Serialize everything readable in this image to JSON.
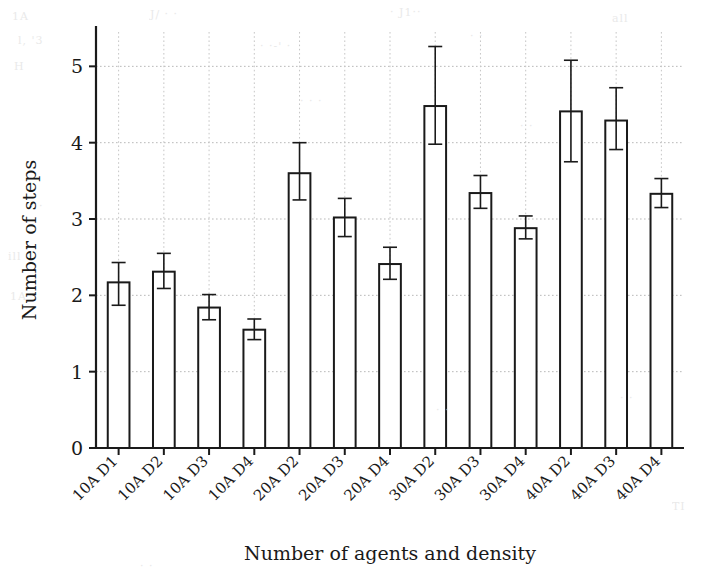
{
  "chart_data": {
    "type": "bar",
    "title": "",
    "xlabel": "Number of agents and density",
    "ylabel": "Number of steps",
    "categories": [
      "10A D1",
      "10A D2",
      "10A D3",
      "10A D4",
      "20A D2",
      "20A D3",
      "20A D4",
      "30A D2",
      "30A D3",
      "30A D4",
      "40A D2",
      "40A D3",
      "40A D4"
    ],
    "values": [
      2.17,
      2.31,
      1.84,
      1.55,
      3.6,
      3.02,
      2.41,
      4.48,
      3.34,
      2.88,
      4.41,
      4.29,
      3.33
    ],
    "errors_low": [
      0.3,
      0.22,
      0.16,
      0.13,
      0.35,
      0.25,
      0.2,
      0.5,
      0.2,
      0.14,
      0.66,
      0.38,
      0.18
    ],
    "errors_high": [
      0.26,
      0.24,
      0.17,
      0.14,
      0.4,
      0.25,
      0.22,
      0.78,
      0.23,
      0.16,
      0.67,
      0.43,
      0.2
    ],
    "ylim": [
      0,
      5.45
    ],
    "yticks": [
      0,
      1,
      2,
      3,
      4,
      5
    ],
    "ytick_labels": [
      "0",
      "1",
      "2",
      "3",
      "4",
      "5"
    ],
    "grid": true,
    "grid_style": "dotted",
    "legend": null,
    "bar_facecolor": "#ffffff",
    "bar_edgecolor": "#1a1a1a",
    "errorbar_color": "#1a1a1a",
    "xtick_rotation": 45
  },
  "background_noise": [
    {
      "text": "1A",
      "x": 12,
      "y": 10
    },
    {
      "text": "J/ · ·",
      "x": 150,
      "y": 8
    },
    {
      "text": "· J1··",
      "x": 390,
      "y": 6
    },
    {
      "text": "all",
      "x": 612,
      "y": 12
    },
    {
      "text": "l, '3",
      "x": 18,
      "y": 34
    },
    {
      "text": "· ·-' ·",
      "x": 260,
      "y": 40
    },
    {
      "text": "· ·",
      "x": 470,
      "y": 30
    },
    {
      "text": "H",
      "x": 14,
      "y": 60
    },
    {
      "text": "· · ·",
      "x": 300,
      "y": 95
    },
    {
      "text": "· ·",
      "x": 520,
      "y": 120
    },
    {
      "text": "· ·",
      "x": 30,
      "y": 200
    },
    {
      "text": "ill",
      "x": 8,
      "y": 250
    },
    {
      "text": "1A",
      "x": 10,
      "y": 290
    },
    {
      "text": "· ·",
      "x": 436,
      "y": 404
    },
    {
      "text": "· ·",
      "x": 620,
      "y": 392
    },
    {
      "text": "TI",
      "x": 672,
      "y": 500
    },
    {
      "text": "· ·",
      "x": 140,
      "y": 560
    }
  ]
}
